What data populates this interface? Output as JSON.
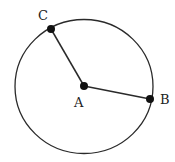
{
  "diagram": {
    "type": "circle-radii",
    "colors": {
      "stroke": "#2a2a2a",
      "point": "#111111",
      "background": "#ffffff"
    },
    "circle": {
      "cx": 84,
      "cy": 86.5,
      "rx": 69,
      "ry": 67
    },
    "points": [
      {
        "id": "A",
        "label": "A",
        "x": 84,
        "y": 86,
        "label_x": 74,
        "label_y": 107,
        "role": "center"
      },
      {
        "id": "B",
        "label": "B",
        "x": 150,
        "y": 99,
        "label_x": 160,
        "label_y": 104,
        "role": "on-circle"
      },
      {
        "id": "C",
        "label": "C",
        "x": 51,
        "y": 29,
        "label_x": 38,
        "label_y": 20,
        "role": "on-circle"
      }
    ],
    "segments": [
      {
        "from": "A",
        "to": "C"
      },
      {
        "from": "A",
        "to": "B"
      }
    ]
  }
}
